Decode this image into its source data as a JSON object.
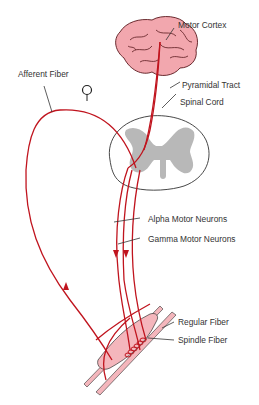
{
  "diagram": {
    "colors": {
      "nerve": "#c0141e",
      "brain_fill": "#f2a7ae",
      "brain_stroke": "#5a1a1e",
      "spinal_gray": "#b8b8b8",
      "muscle_fill": "#f4b6bc",
      "leader": "#333333",
      "text": "#333333"
    },
    "labels": {
      "motor_cortex": "Motor Cortex",
      "afferent_fiber": "Afferent Fiber",
      "pyramidal_tract": "Pyramidal Tract",
      "spinal_cord": "Spinal Cord",
      "alpha_motor_neurons": "Alpha Motor Neurons",
      "gamma_motor_neurons": "Gamma Motor Neurons",
      "regular_fiber": "Regular Fiber",
      "spindle_fiber": "Spindle Fiber"
    },
    "nodes": [
      {
        "id": "motor-cortex",
        "label": "Motor Cortex"
      },
      {
        "id": "pyramidal-tract",
        "label": "Pyramidal Tract"
      },
      {
        "id": "spinal-cord",
        "label": "Spinal Cord"
      },
      {
        "id": "afferent-fiber",
        "label": "Afferent Fiber"
      },
      {
        "id": "alpha-motor-neurons",
        "label": "Alpha Motor Neurons"
      },
      {
        "id": "gamma-motor-neurons",
        "label": "Gamma Motor Neurons"
      },
      {
        "id": "regular-fiber",
        "label": "Regular Fiber"
      },
      {
        "id": "spindle-fiber",
        "label": "Spindle Fiber"
      }
    ],
    "edges": [
      {
        "from": "motor-cortex",
        "to": "spinal-cord",
        "via": "pyramidal-tract"
      },
      {
        "from": "spinal-cord",
        "to": "regular-fiber",
        "via": "alpha-motor-neurons",
        "direction": "down"
      },
      {
        "from": "spinal-cord",
        "to": "spindle-fiber",
        "via": "gamma-motor-neurons",
        "direction": "down"
      },
      {
        "from": "spindle-fiber",
        "to": "spinal-cord",
        "via": "afferent-fiber",
        "direction": "up"
      }
    ]
  }
}
